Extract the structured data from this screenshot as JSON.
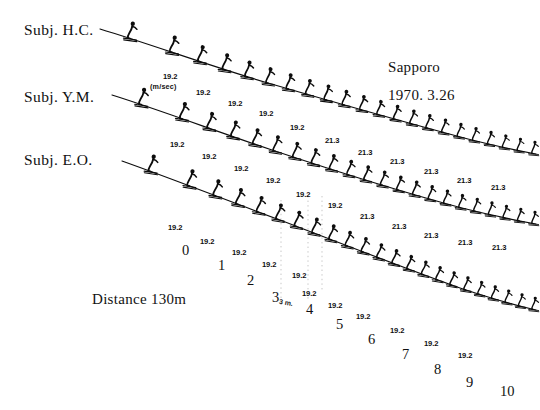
{
  "figure": {
    "place": "Sapporo",
    "date": "1970. 3.26",
    "distance": "Distance 130m",
    "unit": "(m/sec)",
    "gap_marker": "3 m."
  },
  "subjects": [
    {
      "id": "hc",
      "label": "Subj. H.C."
    },
    {
      "id": "ym",
      "label": "Subj. Y.M."
    },
    {
      "id": "eo",
      "label": "Subj. E.O."
    }
  ],
  "markers": {
    "values": [
      "0",
      "1",
      "2",
      "3",
      "4",
      "5",
      "6",
      "7",
      "8",
      "9",
      "10"
    ],
    "positions": [
      {
        "x": 182,
        "y": 243
      },
      {
        "x": 218,
        "y": 258
      },
      {
        "x": 247,
        "y": 273
      },
      {
        "x": 272,
        "y": 290
      },
      {
        "x": 306,
        "y": 302
      },
      {
        "x": 336,
        "y": 317
      },
      {
        "x": 368,
        "y": 332
      },
      {
        "x": 402,
        "y": 347
      },
      {
        "x": 434,
        "y": 362
      },
      {
        "x": 466,
        "y": 375
      },
      {
        "x": 500,
        "y": 384
      }
    ]
  },
  "tracks": [
    {
      "id": "hc",
      "subject": "Subj. H.C.",
      "path": "M 100,29 C 150,44 210,66 268,83 C 330,101 404,122 468,139 C 492,145 514,150 536,154",
      "figure_count": 22,
      "speeds": [
        {
          "value": "19.2",
          "x": 163,
          "y": 73
        },
        {
          "value": "19.2",
          "x": 196,
          "y": 89
        },
        {
          "value": "19.2",
          "x": 228,
          "y": 100
        },
        {
          "value": "19.2",
          "x": 259,
          "y": 110
        },
        {
          "value": "19.2",
          "x": 290,
          "y": 124
        },
        {
          "value": "21.3",
          "x": 325,
          "y": 137
        },
        {
          "value": "21.3",
          "x": 358,
          "y": 149
        },
        {
          "value": "21.3",
          "x": 390,
          "y": 158
        },
        {
          "value": "21.3",
          "x": 424,
          "y": 168
        },
        {
          "value": "21.3",
          "x": 457,
          "y": 177
        },
        {
          "value": "21.3",
          "x": 491,
          "y": 184
        }
      ]
    },
    {
      "id": "ym",
      "subject": "Subj. Y.M.",
      "path": "M 112,95 C 160,110 218,132 272,150 C 332,170 402,192 462,208 C 490,215 514,220 536,224",
      "figure_count": 22,
      "speeds": [
        {
          "value": "19.2",
          "x": 170,
          "y": 141
        },
        {
          "value": "19.2",
          "x": 202,
          "y": 153
        },
        {
          "value": "19.2",
          "x": 234,
          "y": 165
        },
        {
          "value": "19.2",
          "x": 266,
          "y": 177
        },
        {
          "value": "19.2",
          "x": 296,
          "y": 191
        },
        {
          "value": "19.2",
          "x": 328,
          "y": 202
        },
        {
          "value": "21.3",
          "x": 360,
          "y": 213
        },
        {
          "value": "21.3",
          "x": 392,
          "y": 223
        },
        {
          "value": "21.3",
          "x": 424,
          "y": 232
        },
        {
          "value": "21.3",
          "x": 458,
          "y": 239
        },
        {
          "value": "21.3",
          "x": 492,
          "y": 244
        }
      ]
    },
    {
      "id": "eo",
      "subject": "Subj. E.O.",
      "path": "M 122,161 C 170,178 226,200 280,220 C 340,243 404,268 460,288 C 490,298 514,305 536,310",
      "figure_count": 23,
      "speeds": [
        {
          "value": "19.2",
          "x": 168,
          "y": 224
        },
        {
          "value": "19.2",
          "x": 200,
          "y": 238
        },
        {
          "value": "19.2",
          "x": 232,
          "y": 249
        },
        {
          "value": "19.2",
          "x": 262,
          "y": 261
        },
        {
          "value": "19.2",
          "x": 292,
          "y": 272
        },
        {
          "value": "19.2",
          "x": 302,
          "y": 290
        },
        {
          "value": "19.2",
          "x": 328,
          "y": 302
        },
        {
          "value": "19.2",
          "x": 356,
          "y": 313
        },
        {
          "value": "19.2",
          "x": 390,
          "y": 327
        },
        {
          "value": "19.2",
          "x": 424,
          "y": 340
        },
        {
          "value": "19.2",
          "x": 458,
          "y": 352
        }
      ]
    }
  ],
  "dotted_guides": [
    {
      "x": 281,
      "y1": 200,
      "y2": 300
    },
    {
      "x": 308,
      "y1": 196,
      "y2": 300
    },
    {
      "x": 322,
      "y1": 196,
      "y2": 292
    }
  ],
  "chart_data": {
    "type": "line",
    "subtitle": "1970. 3.26",
    "xlabel": "Distance along hill (markers 0-10, 3 m intervals)",
    "ylabel": "Height (flight path profile)",
    "annotations": [
      "Distance 130m",
      "(m/sec)",
      "3 m."
    ],
    "legend": [
      "Subj. H.C.",
      "Subj. Y.M.",
      "Subj. E.O."
    ],
    "grid": false,
    "series": [
      {
        "name": "Subj. H.C.",
        "speeds_m_per_sec": [
          19.2,
          19.2,
          19.2,
          19.2,
          19.2,
          21.3,
          21.3,
          21.3,
          21.3,
          21.3,
          21.3
        ]
      },
      {
        "name": "Subj. Y.M.",
        "speeds_m_per_sec": [
          19.2,
          19.2,
          19.2,
          19.2,
          19.2,
          19.2,
          21.3,
          21.3,
          21.3,
          21.3,
          21.3
        ]
      },
      {
        "name": "Subj. E.O.",
        "speeds_m_per_sec": [
          19.2,
          19.2,
          19.2,
          19.2,
          19.2,
          19.2,
          19.2,
          19.2,
          19.2,
          19.2,
          19.2
        ]
      }
    ],
    "marker_labels": [
      "0",
      "1",
      "2",
      "3",
      "4",
      "5",
      "6",
      "7",
      "8",
      "9",
      "10"
    ]
  }
}
